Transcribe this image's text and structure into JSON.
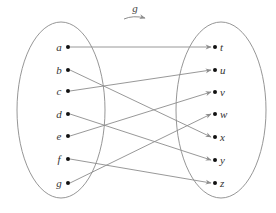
{
  "title": {
    "label": "g"
  },
  "colors": {
    "ellipse": "#8a8a8a",
    "arrow": "#8c8c8c",
    "dot": "#111111",
    "text": "#333333"
  },
  "domain": {
    "ellipse": {
      "cx": 61,
      "cy": 110,
      "rx": 44,
      "ry": 88
    },
    "elements": [
      {
        "label": "a",
        "x": 68,
        "y": 47
      },
      {
        "label": "b",
        "x": 68,
        "y": 70
      },
      {
        "label": "c",
        "x": 68,
        "y": 91
      },
      {
        "label": "d",
        "x": 68,
        "y": 114
      },
      {
        "label": "e",
        "x": 68,
        "y": 136
      },
      {
        "label": "f",
        "x": 68,
        "y": 159
      },
      {
        "label": "g",
        "x": 68,
        "y": 183
      }
    ]
  },
  "codomain": {
    "ellipse": {
      "cx": 221,
      "cy": 110,
      "rx": 45,
      "ry": 88
    },
    "elements": [
      {
        "label": "t",
        "x": 215,
        "y": 47
      },
      {
        "label": "u",
        "x": 215,
        "y": 70
      },
      {
        "label": "v",
        "x": 215,
        "y": 92
      },
      {
        "label": "w",
        "x": 215,
        "y": 114
      },
      {
        "label": "x",
        "x": 215,
        "y": 137
      },
      {
        "label": "y",
        "x": 215,
        "y": 160
      },
      {
        "label": "z",
        "x": 215,
        "y": 183
      }
    ]
  },
  "mapping": [
    {
      "from": "a",
      "to": "t"
    },
    {
      "from": "b",
      "to": "x"
    },
    {
      "from": "c",
      "to": "u"
    },
    {
      "from": "d",
      "to": "y"
    },
    {
      "from": "e",
      "to": "v"
    },
    {
      "from": "f",
      "to": "z"
    },
    {
      "from": "g",
      "to": "w"
    }
  ]
}
